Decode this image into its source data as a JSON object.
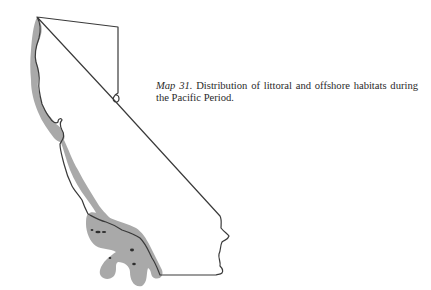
{
  "figure": {
    "caption": {
      "label": "Map 31.",
      "text": "Distribution of littoral and offshore habitats during the Pacific Period."
    },
    "map": {
      "region": "California",
      "shaded_area": "littoral-and-offshore-habitats",
      "colors": {
        "outline": "#3a3a3a",
        "habitat_shading": "#a9a9a9",
        "background": "#ffffff"
      }
    }
  }
}
